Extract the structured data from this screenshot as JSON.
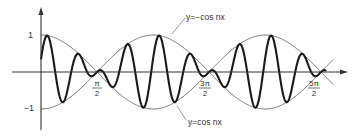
{
  "chart_data": {
    "type": "line",
    "title": "",
    "xlabel": "",
    "ylabel": "",
    "xlim": [
      0,
      8.6
    ],
    "ylim": [
      -1,
      1
    ],
    "x_tick_labels": [
      {
        "num": "π",
        "den": "2",
        "value": 1.5708
      },
      {
        "num": "3π",
        "den": "2",
        "value": 4.7124
      },
      {
        "num": "5π",
        "den": "2",
        "value": 7.854
      }
    ],
    "y_tick_labels": [
      {
        "label": "1",
        "value": 1
      },
      {
        "label": "−1",
        "value": -1
      }
    ],
    "series": [
      {
        "name": "y = cos x · sin(nx)",
        "style": "thick",
        "carrier_frequency": 7
      },
      {
        "name": "y = cos nx",
        "style": "thin",
        "envelope": "cos"
      },
      {
        "name": "y = −cos nx",
        "style": "thin",
        "envelope": "-cos"
      }
    ],
    "annotations": [
      {
        "text": "y=−cos nx",
        "points_to": "upper envelope"
      },
      {
        "text": "y=cos nx",
        "points_to": "lower envelope"
      }
    ]
  },
  "labels": {
    "y_one": "1",
    "y_minus_one": "−1",
    "top_annotation": "y=−cos nx",
    "bottom_annotation": "y=cos nx",
    "tick1_num": "π",
    "tick1_den": "2",
    "tick2_num": "3π",
    "tick2_den": "2",
    "tick3_num": "5π",
    "tick3_den": "2"
  },
  "colors": {
    "curve": "#1a1a1a",
    "axis": "#333333",
    "envelope": "#555555"
  }
}
